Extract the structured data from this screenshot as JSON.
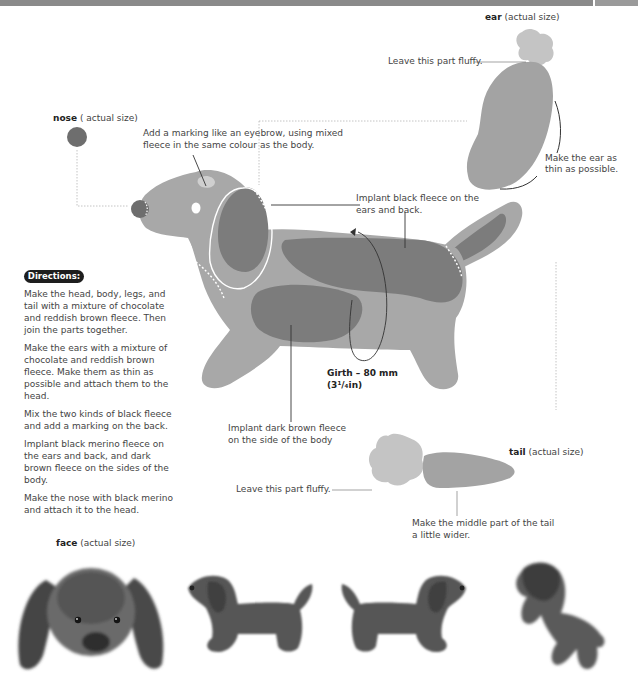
{
  "header": {
    "bar_color": "#8a8a8a"
  },
  "labels": {
    "ear_title": "ear",
    "ear_suffix": " (actual size)",
    "nose_title": "nose",
    "nose_suffix": " ( actual size)",
    "tail_title": "tail",
    "tail_suffix": " (actual size)",
    "face_title": "face",
    "face_suffix": " (actual size)"
  },
  "annotations": {
    "ear_fluffy": "Leave this part fluffy.",
    "ear_thin_1": "Make the ear as",
    "ear_thin_2": "thin as possible.",
    "eyebrow_1": "Add a marking like an eyebrow, using mixed",
    "eyebrow_2": "fleece in the same colour as the body.",
    "black_fleece_1": "Implant black fleece on the",
    "black_fleece_2": "ears and back.",
    "girth_1": "Girth – 80 mm",
    "girth_2": "(3¹/₄in)",
    "dark_brown_1": "Implant dark brown fleece",
    "dark_brown_2": "on the side of the body",
    "tail_fluffy": "Leave this part fluffy.",
    "tail_wider_1": "Make the middle part of the tail",
    "tail_wider_2": "a little wider."
  },
  "directions": {
    "badge": "Directions:",
    "steps": [
      "Make the head, body, legs, and tail with a mixture of chocolate and reddish brown fleece. Then join the parts together.",
      "Make the ears with a mixture of chocolate and reddish brown fleece. Make them as thin as possible and attach them to the head.",
      "Mix the two kinds of black fleece and add a marking on the back.",
      "Implant black merino fleece on the ears and back, and dark brown fleece on the sides of the body.",
      "Make the nose with black merino and attach it to the head."
    ]
  },
  "colors": {
    "body": "#a6a6a6",
    "dark_patch": "#7c7c7c",
    "light_fluff": "#c4c4c4",
    "nose": "#6e6e6e"
  },
  "photos": [
    {
      "caption": "face (actual size)",
      "view": "front"
    },
    {
      "view": "left-side"
    },
    {
      "view": "right-side"
    },
    {
      "view": "three-quarter"
    }
  ]
}
